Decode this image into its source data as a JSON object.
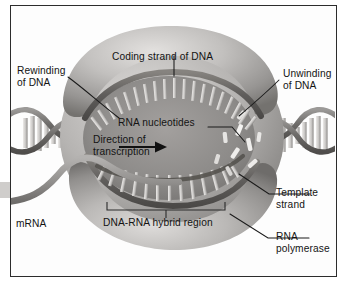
{
  "figure": {
    "style": "grayscale textbook illustration",
    "frame_color": "#2c2c2c",
    "background_color": "#ffffff"
  },
  "labels": {
    "rewinding": "Rewinding\nof DNA",
    "unwinding": "Unwinding\nof DNA",
    "coding_strand": "Coding strand of DNA",
    "rna_nucleotides": "RNA nucleotides",
    "direction": "Direction of\ntranscription",
    "hybrid_region": "DNA-RNA hybrid region",
    "template_strand": "Template\nstrand",
    "rna_polymerase": "RNA\npolymerase",
    "mrna": "mRNA"
  },
  "label_lines": {
    "rewinding": "leader from text down-right to left DNA entry point",
    "unwinding": "leader from text down-left to right DNA exit point",
    "coding_strand": "vertical leader down to upper strand arc",
    "rna_nucleotides": "leader right then down to free nucleotide",
    "template_strand": "leader left to lower strand",
    "rna_polymerase": "leader up-left to lower lobe of enzyme",
    "hybrid_region": "square bracket above text spanning paired region"
  },
  "arrow": {
    "name": "transcription-direction-arrow",
    "direction": "right"
  },
  "mrna_arrow": {
    "name": "mrna-exit-arrow",
    "direction": "left",
    "color": "#c9c9c9"
  },
  "colors": {
    "enzyme_light": "#d8d6d4",
    "enzyme_mid": "#a9a7a5",
    "enzyme_dark": "#6f6d6c",
    "cavity": "#8e8c8a",
    "strand": "#6b6967",
    "nucleotide": "#f2f1ef",
    "mrna": "#9a9896",
    "dna_helix": "#7b7977",
    "text": "#141414"
  },
  "counts": {
    "coding_strand_teeth": 21,
    "template_strand_teeth": 14,
    "free_nucleotides": 9,
    "left_helix_rungs": 11,
    "right_helix_rungs": 11
  }
}
